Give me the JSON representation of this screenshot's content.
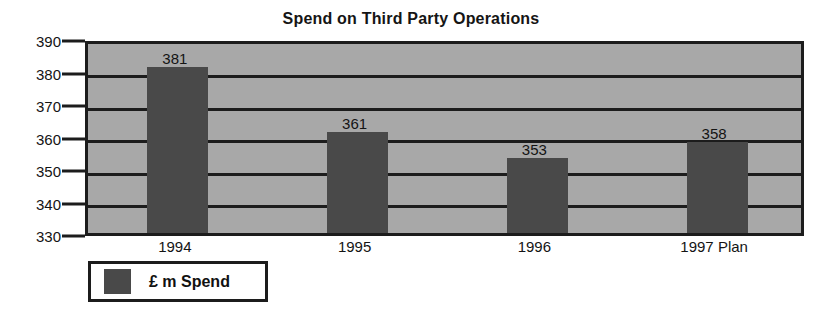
{
  "chart_data": {
    "type": "bar",
    "title": "Spend on Third Party Operations",
    "xlabel": "",
    "ylabel": "",
    "categories": [
      "1994",
      "1995",
      "1996",
      "1997 Plan"
    ],
    "values": [
      381,
      361,
      353,
      358
    ],
    "data_labels": [
      "381",
      "361",
      "353",
      "358"
    ],
    "ylim": [
      330,
      390
    ],
    "yticks": [
      390,
      380,
      370,
      360,
      350,
      340,
      330
    ],
    "ytick_labels": [
      "390",
      "380",
      "370",
      "360",
      "350",
      "340",
      "330"
    ],
    "grid": true,
    "grid_axis": "y",
    "legend": {
      "position": "bottom-left",
      "entries": [
        {
          "label": "£ m Spend",
          "color": "#494949"
        }
      ]
    },
    "series": [
      {
        "name": "£ m Spend",
        "color": "#494949",
        "values": [
          381,
          361,
          353,
          358
        ]
      }
    ],
    "colors": {
      "bar": "#494949",
      "plot_background": "#a8a8a8",
      "axis": "#1c1c1c",
      "text": "#141414",
      "page_background": "#ffffff",
      "legend_background": "#ffffff"
    }
  }
}
